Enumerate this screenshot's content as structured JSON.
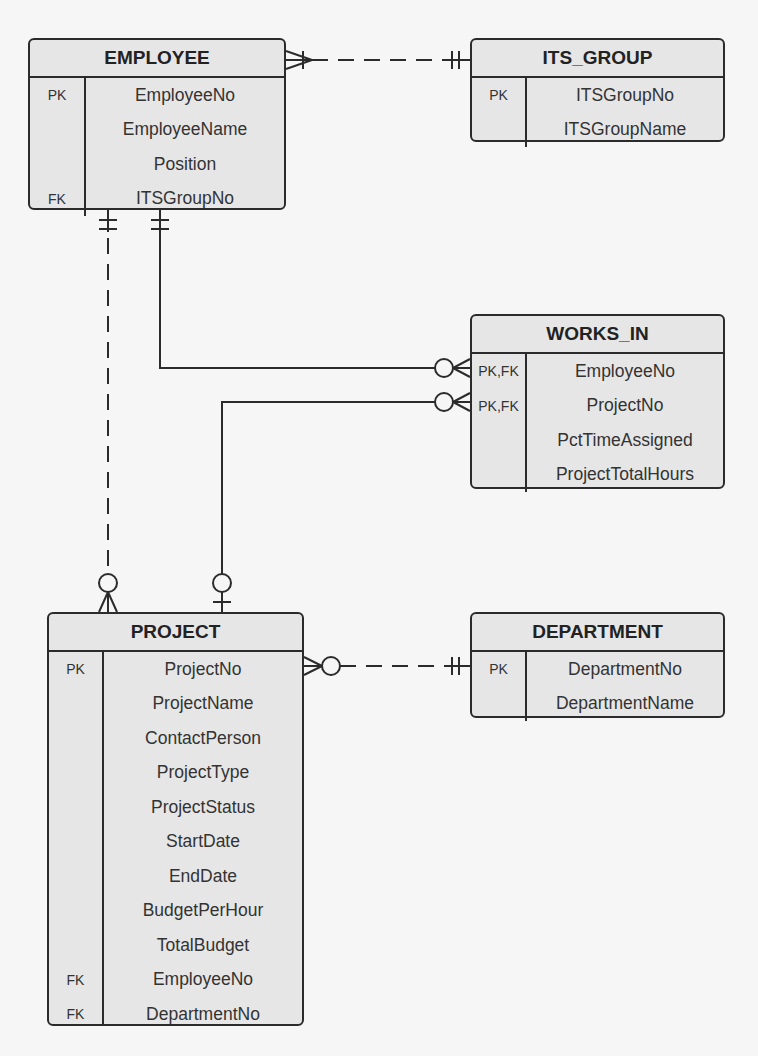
{
  "entities": {
    "employee": {
      "name": "EMPLOYEE",
      "attributes": [
        {
          "key": "PK",
          "name": "EmployeeNo"
        },
        {
          "key": "",
          "name": "EmployeeName"
        },
        {
          "key": "",
          "name": "Position"
        },
        {
          "key": "FK",
          "name": "ITSGroupNo"
        }
      ]
    },
    "its_group": {
      "name": "ITS_GROUP",
      "attributes": [
        {
          "key": "PK",
          "name": "ITSGroupNo"
        },
        {
          "key": "",
          "name": "ITSGroupName"
        }
      ]
    },
    "works_in": {
      "name": "WORKS_IN",
      "attributes": [
        {
          "key": "PK,FK",
          "name": "EmployeeNo"
        },
        {
          "key": "PK,FK",
          "name": "ProjectNo"
        },
        {
          "key": "",
          "name": "PctTimeAssigned"
        },
        {
          "key": "",
          "name": "ProjectTotalHours"
        }
      ]
    },
    "project": {
      "name": "PROJECT",
      "attributes": [
        {
          "key": "PK",
          "name": "ProjectNo"
        },
        {
          "key": "",
          "name": "ProjectName"
        },
        {
          "key": "",
          "name": "ContactPerson"
        },
        {
          "key": "",
          "name": "ProjectType"
        },
        {
          "key": "",
          "name": "ProjectStatus"
        },
        {
          "key": "",
          "name": "StartDate"
        },
        {
          "key": "",
          "name": "EndDate"
        },
        {
          "key": "",
          "name": "BudgetPerHour"
        },
        {
          "key": "",
          "name": "TotalBudget"
        },
        {
          "key": "FK",
          "name": "EmployeeNo"
        },
        {
          "key": "FK",
          "name": "DepartmentNo"
        }
      ]
    },
    "department": {
      "name": "DEPARTMENT",
      "attributes": [
        {
          "key": "PK",
          "name": "DepartmentNo"
        },
        {
          "key": "",
          "name": "DepartmentName"
        }
      ]
    }
  },
  "relationships": [
    {
      "from": "EMPLOYEE",
      "to": "ITS_GROUP",
      "from_cardinality": "one-or-many",
      "to_cardinality": "exactly-one",
      "line": "dashed"
    },
    {
      "from": "EMPLOYEE",
      "to": "WORKS_IN",
      "from_cardinality": "exactly-one",
      "to_cardinality": "zero-or-many",
      "line": "solid"
    },
    {
      "from": "PROJECT",
      "to": "WORKS_IN",
      "from_cardinality": "zero-or-one",
      "to_cardinality": "zero-or-many",
      "line": "solid"
    },
    {
      "from": "EMPLOYEE",
      "to": "PROJECT",
      "from_cardinality": "exactly-one",
      "to_cardinality": "zero-or-many",
      "line": "dashed"
    },
    {
      "from": "PROJECT",
      "to": "DEPARTMENT",
      "from_cardinality": "zero-or-many",
      "to_cardinality": "exactly-one",
      "line": "dashed"
    }
  ]
}
